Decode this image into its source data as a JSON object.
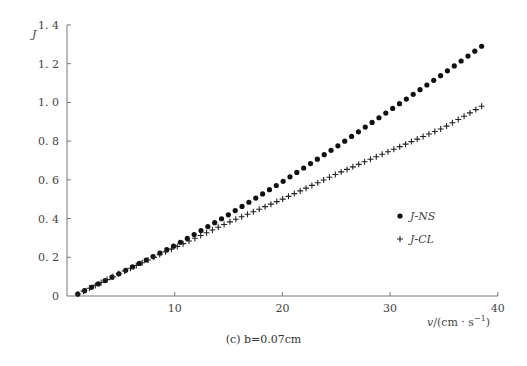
{
  "chart_data": {
    "type": "scatter",
    "title": "",
    "caption": "(c) b=0.07cm",
    "xlabel": "v/(cm · s⁻¹)",
    "ylabel": "J",
    "xlim": [
      0,
      40
    ],
    "ylim": [
      0,
      1.4
    ],
    "xticks": [
      10,
      20,
      30,
      40
    ],
    "yticks": [
      0,
      0.2,
      0.4,
      0.6,
      0.8,
      1.0,
      1.2,
      1.4
    ],
    "grid": false,
    "legend_position": "right-center",
    "series": [
      {
        "name": "J-NS",
        "marker": "dot",
        "x_start": 1,
        "x_end": 38.5,
        "n_points": 60,
        "sample_points": [
          [
            1,
            0.01
          ],
          [
            5,
            0.12
          ],
          [
            10,
            0.26
          ],
          [
            15,
            0.42
          ],
          [
            20,
            0.59
          ],
          [
            25,
            0.77
          ],
          [
            30,
            0.96
          ],
          [
            35,
            1.15
          ],
          [
            38.5,
            1.29
          ]
        ]
      },
      {
        "name": "J-CL",
        "marker": "plus",
        "x_start": 1,
        "x_end": 38.5,
        "n_points": 70,
        "sample_points": [
          [
            1,
            0.01
          ],
          [
            5,
            0.12
          ],
          [
            10,
            0.25
          ],
          [
            15,
            0.38
          ],
          [
            20,
            0.5
          ],
          [
            25,
            0.63
          ],
          [
            30,
            0.75
          ],
          [
            35,
            0.87
          ],
          [
            38.5,
            0.98
          ]
        ]
      }
    ]
  },
  "labels": {
    "ylabel": "J",
    "xlabel_main": "v/(cm · s",
    "xlabel_sup": "−1",
    "xlabel_end": ")",
    "caption": "(c) b=0.07cm",
    "legend_ns": "J-NS",
    "legend_cl": "J-CL",
    "yticks": [
      "0",
      "0. 2",
      "0. 4",
      "0. 6",
      "0. 8",
      "1. 0",
      "1. 2",
      "1. 4"
    ],
    "xticks": [
      "10",
      "20",
      "30",
      "40"
    ]
  }
}
